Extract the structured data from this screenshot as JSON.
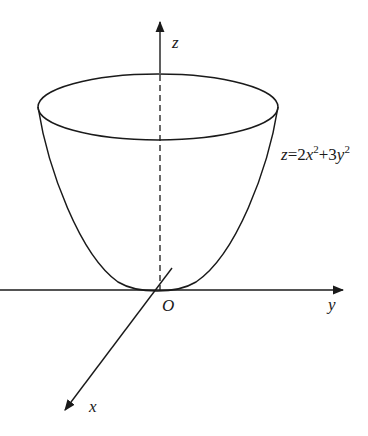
{
  "diagram": {
    "type": "3d-surface-sketch",
    "surface": "elliptic paraboloid",
    "equation_label": {
      "z": "z",
      "eq": "=2",
      "x": "x",
      "x_exp": "2",
      "plus": "+3",
      "y": "y",
      "y_exp": "2"
    },
    "axes": {
      "z_label": "z",
      "y_label": "y",
      "x_label": "x",
      "origin_label": "O"
    },
    "colors": {
      "stroke": "#1a1a1a",
      "background": "#ffffff"
    }
  }
}
